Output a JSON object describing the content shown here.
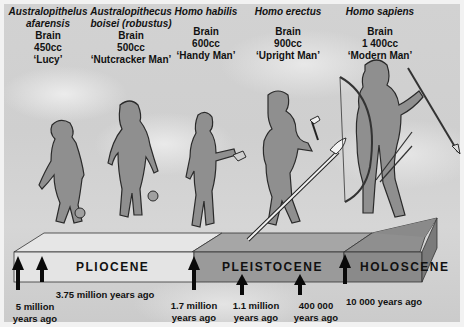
{
  "species": [
    {
      "name_line1": "Australopithelus",
      "name_line2": "afarensis",
      "brain_label": "Brain",
      "brain_size": "450cc",
      "nickname": "‘Lucy’"
    },
    {
      "name_line1": "Australopithecus",
      "name_line2": "boisei (robustus)",
      "brain_label": "Brain",
      "brain_size": "500cc",
      "nickname": "‘Nutcracker Man’"
    },
    {
      "name_line1": "Homo habilis",
      "name_line2": "",
      "brain_label": "Brain",
      "brain_size": "600cc",
      "nickname": "‘Handy Man’"
    },
    {
      "name_line1": "Homo erectus",
      "name_line2": "",
      "brain_label": "Brain",
      "brain_size": "900cc",
      "nickname": "‘Upright Man’"
    },
    {
      "name_line1": "Homo sapiens",
      "name_line2": "",
      "brain_label": "Brain",
      "brain_size": "1 400cc",
      "nickname": "‘Modern Man’"
    }
  ],
  "epochs": [
    {
      "name": "PLIOCENE",
      "color": "#e2e2e2"
    },
    {
      "name": "PLEISTOCENE",
      "color": "#9a9a9a"
    },
    {
      "name": "HOLOSCENE",
      "color": "#858585"
    }
  ],
  "dates": [
    {
      "line1": "5 million",
      "line2": "years ago"
    },
    {
      "line1": "3.75 million years ago",
      "line2": ""
    },
    {
      "line1": "1.7 million",
      "line2": "years ago"
    },
    {
      "line1": "1.1 million",
      "line2": "years ago"
    },
    {
      "line1": "400 000",
      "line2": "years ago"
    },
    {
      "line1": "10 000 years ago",
      "line2": ""
    }
  ],
  "colors": {
    "figure_fill": "#8f8f8f",
    "figure_outline": "#2a2a2a",
    "arrow": "#0a0a0a"
  }
}
